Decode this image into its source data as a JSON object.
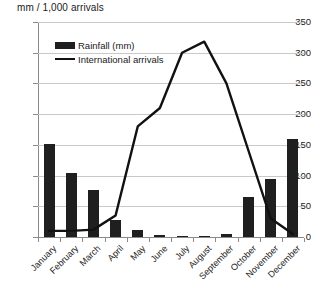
{
  "chart_data": {
    "type": "bar",
    "title": "",
    "subtitle": "",
    "ylabel": "mm / 1,000 arrivals",
    "xlabel": "",
    "ylim": [
      0,
      350
    ],
    "ytick_step": 50,
    "yticks": [
      "350",
      "300",
      "250",
      "200",
      "150",
      "100",
      "50",
      "0"
    ],
    "grid": true,
    "legend_position": "top-left-inside",
    "categories": [
      "January",
      "February",
      "March",
      "April",
      "May",
      "June",
      "July",
      "August",
      "September",
      "October",
      "November",
      "December"
    ],
    "series": [
      {
        "name": "Rainfall (mm)",
        "type": "bar",
        "color": "#1f1f1f",
        "values": [
          151,
          105,
          77,
          28,
          12,
          3,
          2,
          2,
          5,
          65,
          95,
          160
        ]
      },
      {
        "name": "International arrivals",
        "type": "line",
        "color": "#111111",
        "values": [
          10,
          10,
          12,
          35,
          180,
          210,
          300,
          318,
          250,
          140,
          30,
          5
        ]
      }
    ]
  },
  "legend": {
    "items": [
      {
        "label": "Rainfall (mm)",
        "marker": "bar-swatch"
      },
      {
        "label": "International arrivals",
        "marker": "line-swatch"
      }
    ]
  }
}
